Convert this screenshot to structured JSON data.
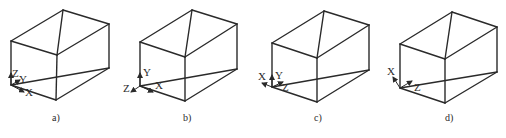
{
  "figure": {
    "panels": [
      {
        "id": "a",
        "caption": "a)",
        "caption_pos": [
          52,
          121
        ],
        "box": {
          "top_back": [
            63,
            10
          ],
          "top_right": [
            109,
            24
          ],
          "top_left": [
            11,
            41
          ],
          "top_front": [
            57,
            55
          ],
          "bottom_left": [
            11,
            85
          ],
          "bottom_front": [
            56,
            100
          ],
          "bottom_right": [
            109,
            68
          ]
        },
        "origin": [
          11,
          85
        ],
        "axes": [
          {
            "label": "Z",
            "tip": [
              11,
              73
            ],
            "label_pos": [
              12,
              77
            ]
          },
          {
            "label": "Y",
            "tip": [
              20,
              80
            ],
            "label_pos": [
              19,
              83
            ]
          },
          {
            "label": "X",
            "tip": [
              24,
              92
            ],
            "label_pos": [
              25,
              96
            ]
          }
        ]
      },
      {
        "id": "b",
        "caption": "b)",
        "caption_pos": [
          183,
          121
        ],
        "box": {
          "top_back": [
            192,
            10
          ],
          "top_right": [
            237,
            24
          ],
          "top_left": [
            140,
            42
          ],
          "top_front": [
            185,
            57
          ],
          "bottom_left": [
            140,
            86
          ],
          "bottom_front": [
            185,
            101
          ],
          "bottom_right": [
            237,
            69
          ]
        },
        "origin": [
          140,
          86
        ],
        "axes": [
          {
            "label": "Y",
            "tip": [
              140,
              73
            ],
            "label_pos": [
              143,
              76
            ]
          },
          {
            "label": "Z",
            "tip": [
              131,
              92
            ],
            "label_pos": [
              123,
              92
            ]
          },
          {
            "label": "X",
            "tip": [
              153,
              92
            ],
            "label_pos": [
              155,
              89
            ]
          }
        ]
      },
      {
        "id": "c",
        "caption": "c)",
        "caption_pos": [
          314,
          121
        ],
        "box": {
          "top_back": [
            324,
            11
          ],
          "top_right": [
            369,
            25
          ],
          "top_left": [
            272,
            43
          ],
          "top_front": [
            317,
            58
          ],
          "bottom_left": [
            272,
            87
          ],
          "bottom_front": [
            317,
            102
          ],
          "bottom_right": [
            369,
            70
          ]
        },
        "origin": [
          272,
          87
        ],
        "axes": [
          {
            "label": "Y",
            "tip": [
              272,
              75
            ],
            "label_pos": [
              275,
              79
            ]
          },
          {
            "label": "X",
            "tip": [
              262,
              83
            ],
            "label_pos": [
              258,
              80
            ]
          },
          {
            "label": "Z",
            "tip": [
              283,
              82
            ],
            "label_pos": [
              282,
              91
            ]
          }
        ]
      },
      {
        "id": "d",
        "caption": "d)",
        "caption_pos": [
          445,
          121
        ],
        "box": {
          "top_back": [
            452,
            12
          ],
          "top_right": [
            497,
            27
          ],
          "top_left": [
            400,
            44
          ],
          "top_front": [
            445,
            59
          ],
          "bottom_left": [
            400,
            88
          ],
          "bottom_front": [
            445,
            103
          ],
          "bottom_right": [
            497,
            72
          ]
        },
        "origin": [
          400,
          88
        ],
        "axes": [
          {
            "label": "X",
            "tip": [
              393,
              77
            ],
            "label_pos": [
              387,
              75
            ]
          },
          {
            "label": "Z",
            "tip": [
              412,
              81
            ],
            "label_pos": [
              414,
              91
            ]
          }
        ]
      }
    ]
  }
}
